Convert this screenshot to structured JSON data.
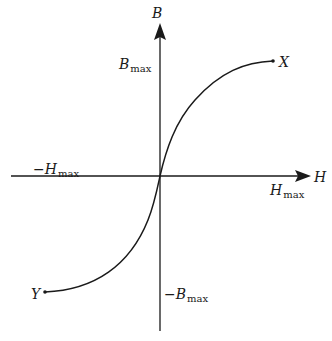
{
  "diagram": {
    "type": "B-H magnetization curve",
    "axes": {
      "horizontal": {
        "label": "H"
      },
      "vertical": {
        "label": "B"
      }
    },
    "labels": {
      "b_max": {
        "main": "B",
        "sub": "max"
      },
      "neg_b_max": {
        "neg": "−",
        "main": "B",
        "sub": "max"
      },
      "h_max": {
        "main": "H",
        "sub": "max"
      },
      "neg_h_max": {
        "neg": "−",
        "main": "H",
        "sub": "max"
      },
      "point_x": "X",
      "point_y": "Y"
    },
    "colors": {
      "stroke": "#1a1a1a",
      "background": "#ffffff"
    }
  }
}
